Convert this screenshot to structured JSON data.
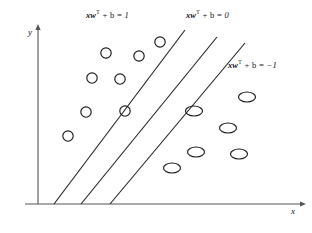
{
  "figure": {
    "kind": "svm-maximum-margin-diagram",
    "axes": {
      "x_label": "x",
      "y_label": "y",
      "x_axis": {
        "x1": 25,
        "y1": 204,
        "x2": 300,
        "y2": 204,
        "arrow": "right"
      },
      "y_axis": {
        "x1": 38,
        "y1": 204,
        "x2": 38,
        "y2": 30,
        "arrow": "up"
      }
    },
    "line_color": "#262626",
    "axis_color": "#555555",
    "marker_stroke": "#1a1a1a",
    "labels": [
      {
        "name": "margin-upper-label",
        "text_plain": "xw^T + b = 1",
        "vec": "xw",
        "sup": "T",
        "rest": " + b = 1",
        "x": 86,
        "y": 9
      },
      {
        "name": "hyperplane-label",
        "text_plain": "xw^T + b = 0",
        "vec": "xw",
        "sup": "T",
        "rest": " + b = 0",
        "x": 186,
        "y": 9
      },
      {
        "name": "margin-lower-label",
        "text_plain": "xw^T + b = -1",
        "vec": "xw",
        "sup": "T",
        "rest": " + b = −1",
        "x": 228,
        "y": 59
      }
    ],
    "boundary_lines": [
      {
        "name": "margin-line-positive",
        "equation": "xw^T + b = 1",
        "x1": 54,
        "y1": 204,
        "x2": 185,
        "y2": 30
      },
      {
        "name": "decision-hyperplane",
        "equation": "xw^T + b = 0",
        "x1": 81,
        "y1": 204,
        "x2": 217,
        "y2": 37
      },
      {
        "name": "margin-line-negative",
        "equation": "xw^T + b = -1",
        "x1": 110,
        "y1": 204,
        "x2": 245,
        "y2": 43
      }
    ],
    "class_positive": {
      "name": "class-circle-markers",
      "shape": "circle",
      "rx": 5.2,
      "ry": 5.2,
      "points": [
        {
          "cx": 160,
          "cy": 42
        },
        {
          "cx": 106,
          "cy": 53
        },
        {
          "cx": 139,
          "cy": 56
        },
        {
          "cx": 92,
          "cy": 78
        },
        {
          "cx": 120,
          "cy": 79
        },
        {
          "cx": 86,
          "cy": 112
        },
        {
          "cx": 125,
          "cy": 111
        },
        {
          "cx": 68,
          "cy": 136
        }
      ]
    },
    "class_negative": {
      "name": "class-ellipse-markers",
      "shape": "ellipse",
      "rx": 8.5,
      "ry": 5.0,
      "points": [
        {
          "cx": 247,
          "cy": 97
        },
        {
          "cx": 194,
          "cy": 111
        },
        {
          "cx": 228,
          "cy": 128
        },
        {
          "cx": 196,
          "cy": 152
        },
        {
          "cx": 239,
          "cy": 154
        },
        {
          "cx": 172,
          "cy": 168
        }
      ]
    },
    "caption": ""
  }
}
